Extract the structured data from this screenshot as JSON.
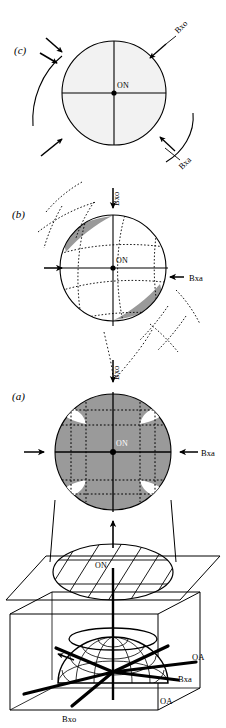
{
  "figure": {
    "background_color": "#ffffff",
    "stroke_color": "#000000",
    "panels": [
      {
        "id": "c",
        "label": "(c)",
        "center_label": "ON",
        "fill_color": "#f2f2f2",
        "description": "circle with crosshair and curved arc arrows",
        "annotations": [
          {
            "name": "bxo",
            "text": "Bxo",
            "position": "upper-right",
            "rotation": -45
          },
          {
            "name": "bxa",
            "text": "Bxa",
            "position": "lower-right",
            "rotation": -45
          }
        ]
      },
      {
        "id": "b",
        "label": "(b)",
        "center_label": "ON",
        "fill_color": "#ffffff",
        "lune_color": "#9a9a9a",
        "description": "circle with curved dotted grid and gray lunes",
        "annotations": [
          {
            "name": "bxo",
            "text": "Bxo",
            "position": "top",
            "rotation": -90
          },
          {
            "name": "bxa",
            "text": "Bxa",
            "position": "right",
            "rotation": 0
          }
        ]
      },
      {
        "id": "a",
        "label": "(a)",
        "center_label": "ON",
        "fill_color": "#9a9a9a",
        "lobe_color": "#ffffff",
        "description": "gray filled circle with four white lobes and dotted square grid",
        "annotations": [
          {
            "name": "bxo",
            "text": "Bxo",
            "position": "top",
            "rotation": -90
          },
          {
            "name": "bxa",
            "text": "Bxa",
            "position": "right",
            "rotation": 0
          }
        ]
      }
    ],
    "middle_section": {
      "name": "hatched-ellipse-plane",
      "center_label": "ON",
      "description": "hatched ellipse lying in a parallelogram plane"
    },
    "block_diagram": {
      "name": "indicatrix-block",
      "description": "3D box containing wireframe dome with radiating axes",
      "labels": [
        {
          "name": "oa-upper",
          "text": "OA"
        },
        {
          "name": "bxa",
          "text": "Bxa"
        },
        {
          "name": "oa-lower",
          "text": "OA"
        },
        {
          "name": "bxo",
          "text": "Bxo"
        }
      ]
    }
  }
}
